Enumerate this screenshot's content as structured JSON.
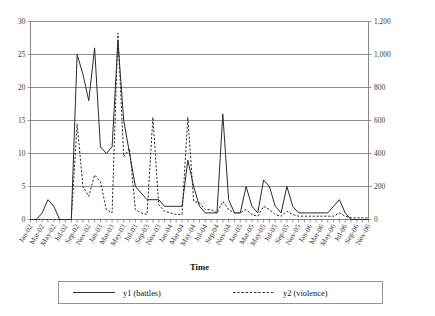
{
  "chart_data": {
    "type": "line",
    "title": "",
    "xlabel": "Time",
    "ylabel": "",
    "grid": true,
    "legend_position": "bottom",
    "x": [
      "Jan-02",
      "Feb-02",
      "Mar-02",
      "Apr-02",
      "May-02",
      "Jun-02",
      "Jul-02",
      "Aug-02",
      "Sep-02",
      "Oct-02",
      "Nov-02",
      "Dec-02",
      "Jan-03",
      "Feb-03",
      "Mar-03",
      "Apr-03",
      "May-03",
      "Jun-03",
      "Jul-03",
      "Aug-03",
      "Sep-03",
      "Oct-03",
      "Nov-03",
      "Dec-03",
      "Jan-04",
      "Feb-04",
      "Mar-04",
      "Apr-04",
      "May-04",
      "Jun-04",
      "Jul-04",
      "Aug-04",
      "Sep-04",
      "Oct-04",
      "Nov-04",
      "Dec-04",
      "Jan-05",
      "Feb-05",
      "Mar-05",
      "Apr-05",
      "May-05",
      "Jun-05",
      "Jul-05",
      "Aug-05",
      "Sep-05",
      "Oct-05",
      "Nov-05",
      "Dec-05",
      "Jan-06",
      "Feb-06",
      "Mar-06",
      "Apr-06",
      "May-06",
      "Jun-06",
      "Jul-06",
      "Aug-06",
      "Sep-06",
      "Oct-06",
      "Nov-06"
    ],
    "xtick_labels": [
      "Jan-02",
      "Mar-02",
      "May-02",
      "Jul-02",
      "Sep-02",
      "Nov-02",
      "Jan-03",
      "Mar-03",
      "May-03",
      "Jul-03",
      "Sep-03",
      "Nov-03",
      "Jan-04",
      "Mar-04",
      "May-04",
      "Jul-04",
      "Sep-04",
      "Nov-04",
      "Jan-05",
      "Mar-05",
      "May-05",
      "Jul-05",
      "Sep-05",
      "Nov-05",
      "Jan-06",
      "Mar-06",
      "May-06",
      "Jul-06",
      "Sep-06",
      "Nov-06"
    ],
    "y_left": {
      "label": "",
      "ticks": [
        0,
        5,
        10,
        15,
        20,
        25,
        30
      ],
      "tick_labels": [
        "0",
        "5",
        "10",
        "15",
        "20",
        "25",
        "30"
      ],
      "ylim": [
        0,
        30
      ]
    },
    "y_right": {
      "label": "",
      "ticks": [
        0,
        200,
        400,
        600,
        800,
        1000,
        1200
      ],
      "tick_labels": [
        "0",
        "200",
        "400",
        "600",
        "800",
        "1,000",
        "1,200"
      ],
      "ylim": [
        0,
        1200
      ]
    },
    "series": [
      {
        "name": "y1 (battles)",
        "axis": "left",
        "style": "solid",
        "color": "#2b2b2b",
        "values": [
          0,
          0,
          1,
          3,
          2,
          0,
          0,
          0,
          25,
          22,
          18,
          26,
          11,
          10,
          11,
          27,
          15,
          10,
          5,
          4,
          3,
          3,
          3,
          2,
          2,
          2,
          2,
          9,
          5,
          2,
          1,
          1,
          1,
          16,
          3,
          1,
          1,
          5,
          2,
          1,
          6,
          5,
          2,
          1,
          5,
          2,
          1,
          1,
          1,
          1,
          1,
          1,
          2,
          3,
          1,
          0,
          0,
          0,
          0
        ]
      },
      {
        "name": "y2 (violence)",
        "axis": "right",
        "style": "dashed",
        "color": "#2b2b2b",
        "values": [
          0,
          0,
          0,
          0,
          0,
          0,
          0,
          0,
          580,
          200,
          140,
          270,
          230,
          60,
          40,
          1130,
          380,
          430,
          60,
          40,
          30,
          620,
          90,
          50,
          40,
          30,
          30,
          620,
          110,
          100,
          60,
          60,
          40,
          110,
          60,
          40,
          40,
          60,
          30,
          20,
          80,
          60,
          30,
          20,
          50,
          30,
          20,
          20,
          20,
          20,
          20,
          20,
          20,
          40,
          20,
          10,
          10,
          10,
          10
        ]
      }
    ],
    "legend": [
      {
        "label": "y1 (battles)",
        "style": "solid"
      },
      {
        "label": "y2 (violence)",
        "style": "dashed"
      }
    ]
  }
}
